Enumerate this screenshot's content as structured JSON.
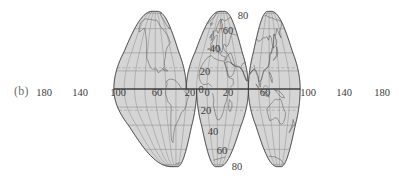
{
  "figure": {
    "panel_label": "(b)",
    "projection_name": "goode-homolosine-interrupted-world-map",
    "width": 399,
    "height": 180
  },
  "colors": {
    "ocean_fill": "#d5d5d5",
    "land_fill": "#d5d5d5",
    "graticule": "#8a8a8a",
    "coastline": "#5a5a5a",
    "outline": "#3c3c3c",
    "label_text": "#3a3a3a",
    "panel_label_text": "#6e6e6e",
    "background": "#ffffff",
    "tropic_dash": "#9a9a9a"
  },
  "longitude_labels": [
    {
      "text": "180",
      "x": 44,
      "y": 92
    },
    {
      "text": "140",
      "x": 80,
      "y": 92
    },
    {
      "text": "100",
      "x": 118,
      "y": 92
    },
    {
      "text": "60",
      "x": 157,
      "y": 92
    },
    {
      "text": "20",
      "x": 190,
      "y": 92
    },
    {
      "text": "0",
      "x": 207,
      "y": 92
    },
    {
      "text": "20",
      "x": 228,
      "y": 92
    },
    {
      "text": "60",
      "x": 265,
      "y": 92
    },
    {
      "text": "100",
      "x": 308,
      "y": 92
    },
    {
      "text": "140",
      "x": 344,
      "y": 92
    },
    {
      "text": "180",
      "x": 382,
      "y": 92
    }
  ],
  "latitude_labels": [
    {
      "text": "80",
      "x": 243,
      "y": 15
    },
    {
      "text": "60",
      "x": 228,
      "y": 30
    },
    {
      "text": "40",
      "x": 215,
      "y": 48
    },
    {
      "text": "20",
      "x": 205,
      "y": 71
    },
    {
      "text": "0",
      "x": 201,
      "y": 89
    },
    {
      "text": "20",
      "x": 206,
      "y": 110
    },
    {
      "text": "40",
      "x": 213,
      "y": 131
    },
    {
      "text": "60",
      "x": 222,
      "y": 150
    },
    {
      "text": "80",
      "x": 237,
      "y": 166
    }
  ],
  "graticule": {
    "latitude_interval_deg": 20,
    "longitude_interval_deg": 20,
    "tropics_dashed": true,
    "tropic_of_cancer_deg": 23.5,
    "tropic_of_capricorn_deg": -23.5
  },
  "lobes": [
    {
      "name": "north-america-lobe",
      "central_meridian_deg": -100,
      "hemisphere": "north"
    },
    {
      "name": "south-america-lobe",
      "central_meridian_deg": -60,
      "hemisphere": "south"
    },
    {
      "name": "europe-africa-lobe",
      "central_meridian_deg": 20,
      "hemisphere": "both"
    },
    {
      "name": "asia-lobe",
      "central_meridian_deg": 60,
      "hemisphere": "north"
    },
    {
      "name": "australia-lobe",
      "central_meridian_deg": 140,
      "hemisphere": "both"
    }
  ]
}
